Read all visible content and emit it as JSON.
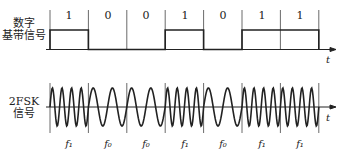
{
  "diagram": {
    "top_label_line1": "数字",
    "top_label_line2": "基带信号",
    "bottom_label_line1": "2FSK",
    "bottom_label_line2": "信号",
    "time_axis_label": "t",
    "bits": [
      "1",
      "0",
      "0",
      "1",
      "0",
      "1",
      "1"
    ],
    "frequencies": [
      "f₁",
      "f₀",
      "f₀",
      "f₁",
      "f₀",
      "f₁",
      "f₁"
    ],
    "cycles_per_bit": {
      "f1": 4,
      "f0": 2
    },
    "line_color": "#222222"
  }
}
